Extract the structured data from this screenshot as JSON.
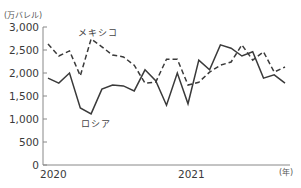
{
  "chart_data": {
    "type": "line",
    "title": "",
    "ylabel": "(万バレル)",
    "xlabel": "(年)",
    "ylim": [
      0,
      3000
    ],
    "yticks": [
      0,
      500,
      1000,
      1500,
      2000,
      2500,
      3000
    ],
    "ytick_labels": [
      "0",
      "500",
      "1,000",
      "1,500",
      "2,000",
      "2,500",
      "3,000"
    ],
    "xtick_labels": [
      "2020",
      "2021"
    ],
    "grid": false,
    "legend": "inline labels",
    "x_index": [
      0,
      1,
      2,
      3,
      4,
      5,
      6,
      7,
      8,
      9,
      10,
      11,
      12,
      13,
      14,
      15,
      16,
      17,
      18,
      19,
      20,
      21,
      22
    ],
    "series": [
      {
        "name": "メキシコ",
        "style": "dashed",
        "values": [
          2630,
          2370,
          2480,
          1940,
          2740,
          2570,
          2390,
          2350,
          2170,
          1780,
          1800,
          2300,
          2300,
          1740,
          1800,
          2020,
          2170,
          2240,
          2610,
          2280,
          2460,
          2020,
          2130
        ]
      },
      {
        "name": "ロシア",
        "style": "solid",
        "values": [
          1890,
          1780,
          2000,
          1240,
          1110,
          1650,
          1740,
          1720,
          1610,
          2070,
          1830,
          1300,
          2000,
          1330,
          2280,
          2070,
          2610,
          2540,
          2370,
          2460,
          1890,
          1960,
          1780
        ]
      }
    ]
  },
  "labels": {
    "unit": "(万バレル)",
    "year_unit": "(年)",
    "mexico": "メキシコ",
    "russia": "ロシア"
  },
  "colors": {
    "line": "#3a3a3a",
    "axis": "#888888"
  }
}
